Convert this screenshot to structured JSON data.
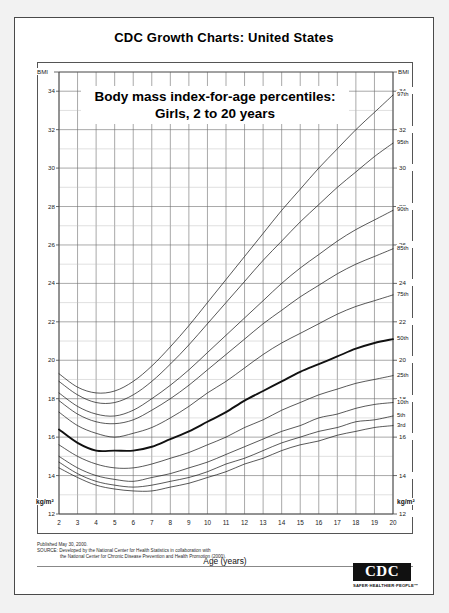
{
  "header": {
    "title": "CDC Growth Charts: United States"
  },
  "chart_title": {
    "line1": "Body mass index-for-age percentiles:",
    "line2": "Girls, 2 to 20 years"
  },
  "axes": {
    "y_header_left": "BMI",
    "y_header_right": "BMI",
    "y_unit_left": "kg/m²",
    "y_unit_right": "kg/m²",
    "x_title": "Age (years)",
    "y_ticks": [
      34,
      32,
      30,
      28,
      26,
      24,
      22,
      20,
      18,
      16,
      14,
      12
    ],
    "x_ticks": [
      2,
      3,
      4,
      5,
      6,
      7,
      8,
      9,
      10,
      11,
      12,
      13,
      14,
      15,
      16,
      17,
      18,
      19,
      20
    ]
  },
  "footer": {
    "published": "Published May 30, 2000.",
    "source_line1": "SOURCE: Developed by the National Center for Health Statistics in collaboration with",
    "source_line2": "the National Center for Chronic Disease Prevention and Health Promotion (2000)."
  },
  "logo": {
    "mark": "CDC",
    "tagline": "SAFER·HEALTHIER·PEOPLE™"
  },
  "chart_data": {
    "type": "line",
    "title": "Body mass index-for-age percentiles: Girls, 2 to 20 years",
    "xlabel": "Age (years)",
    "ylabel": "BMI",
    "yunit": "kg/m²",
    "xlim": [
      2,
      20
    ],
    "ylim": [
      12,
      35
    ],
    "grid": true,
    "legend": "inline-right-labels",
    "x": [
      2,
      3,
      4,
      5,
      6,
      7,
      8,
      9,
      10,
      11,
      12,
      13,
      14,
      15,
      16,
      17,
      18,
      19,
      20
    ],
    "series": [
      {
        "name": "97th",
        "label": "97th",
        "emphasis": false,
        "values": [
          19.3,
          18.6,
          18.3,
          18.4,
          18.9,
          19.7,
          20.7,
          21.8,
          23.0,
          24.2,
          25.4,
          26.6,
          27.8,
          28.9,
          30.0,
          31.0,
          32.0,
          32.9,
          33.8
        ]
      },
      {
        "name": "95th",
        "label": "95th",
        "emphasis": false,
        "values": [
          18.9,
          18.2,
          17.8,
          17.8,
          18.2,
          18.9,
          19.8,
          20.8,
          21.9,
          23.0,
          24.1,
          25.2,
          26.2,
          27.2,
          28.1,
          29.0,
          29.8,
          30.6,
          31.3
        ]
      },
      {
        "name": "90th",
        "label": "90th",
        "emphasis": false,
        "values": [
          18.3,
          17.6,
          17.2,
          17.1,
          17.4,
          18.0,
          18.7,
          19.5,
          20.4,
          21.3,
          22.2,
          23.1,
          24.0,
          24.8,
          25.5,
          26.2,
          26.8,
          27.3,
          27.8
        ]
      },
      {
        "name": "85th",
        "label": "85th",
        "emphasis": false,
        "values": [
          17.9,
          17.2,
          16.8,
          16.7,
          16.9,
          17.4,
          18.0,
          18.7,
          19.5,
          20.3,
          21.1,
          21.9,
          22.6,
          23.3,
          23.9,
          24.5,
          25.0,
          25.4,
          25.8
        ]
      },
      {
        "name": "75th",
        "label": "75th",
        "emphasis": false,
        "values": [
          17.3,
          16.6,
          16.2,
          16.0,
          16.2,
          16.5,
          17.0,
          17.6,
          18.3,
          18.9,
          19.6,
          20.3,
          20.9,
          21.4,
          21.9,
          22.4,
          22.8,
          23.1,
          23.4
        ]
      },
      {
        "name": "50th",
        "label": "50th",
        "emphasis": true,
        "values": [
          16.4,
          15.7,
          15.3,
          15.3,
          15.3,
          15.5,
          15.9,
          16.3,
          16.8,
          17.3,
          17.9,
          18.4,
          18.9,
          19.4,
          19.8,
          20.2,
          20.6,
          20.9,
          21.1
        ]
      },
      {
        "name": "25th",
        "label": "25th",
        "emphasis": false,
        "values": [
          15.6,
          15.0,
          14.6,
          14.4,
          14.4,
          14.6,
          14.9,
          15.2,
          15.6,
          16.0,
          16.5,
          16.9,
          17.4,
          17.8,
          18.2,
          18.5,
          18.8,
          19.0,
          19.2
        ]
      },
      {
        "name": "10th",
        "label": "10th",
        "emphasis": false,
        "values": [
          15.0,
          14.4,
          14.0,
          13.8,
          13.7,
          13.9,
          14.1,
          14.4,
          14.7,
          15.1,
          15.5,
          15.9,
          16.3,
          16.6,
          17.0,
          17.2,
          17.5,
          17.7,
          17.8
        ]
      },
      {
        "name": "5th",
        "label": "5th",
        "emphasis": false,
        "values": [
          14.7,
          14.1,
          13.7,
          13.5,
          13.4,
          13.5,
          13.7,
          13.9,
          14.2,
          14.6,
          14.9,
          15.3,
          15.7,
          16.0,
          16.3,
          16.5,
          16.8,
          16.9,
          17.1
        ]
      },
      {
        "name": "3rd",
        "label": "3rd",
        "emphasis": false,
        "values": [
          14.4,
          13.9,
          13.5,
          13.3,
          13.2,
          13.2,
          13.4,
          13.6,
          13.9,
          14.2,
          14.6,
          14.9,
          15.3,
          15.6,
          15.8,
          16.1,
          16.3,
          16.5,
          16.6
        ]
      }
    ]
  }
}
